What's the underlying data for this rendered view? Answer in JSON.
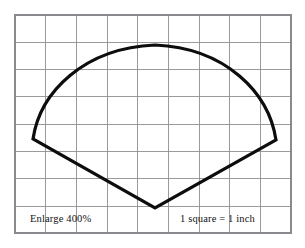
{
  "figure": {
    "background_color": "#ffffff",
    "grid": {
      "line_color": "#8f8f93",
      "border_color": "#8a8a8e",
      "columns": 9,
      "rows": 8,
      "cell_width_px": 30.7,
      "cell_height_px": 27.3,
      "left_px": 15,
      "top_px": 15,
      "right_px": 291,
      "bottom_px": 233,
      "unit_label": "1 square = 1 inch"
    },
    "outline": {
      "stroke_color": "#0d0d0d",
      "stroke_width_px": 3.2,
      "description": "Closed fan / shield shape: curved arc across the top, straight edges down to a point at bottom center",
      "vertices": {
        "left_corner": [
          33,
          139
        ],
        "arc_apex": [
          155,
          45
        ],
        "right_corner": [
          276,
          140
        ],
        "bottom_point": [
          155,
          208
        ]
      },
      "path": "M 33 139 C 40 92, 84 48, 155 45 C 226 48, 269 93, 276 140 L 155 208 Z"
    },
    "labels": {
      "enlarge": {
        "text": "Enlarge 400%",
        "x": 30,
        "y": 222
      },
      "scale": {
        "text": "1 square = 1 inch",
        "x": 180,
        "y": 222
      }
    }
  }
}
